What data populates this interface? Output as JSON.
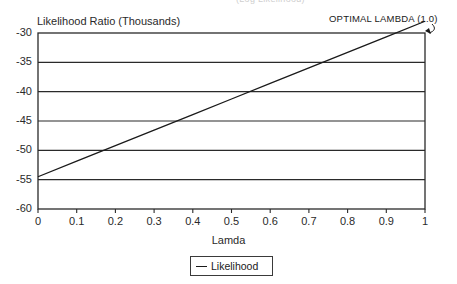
{
  "clipped_top_text": "(Log Likelihood)",
  "annotation": {
    "text": "OPTIMAL LAMBDA (1.0)",
    "arrow_icon": "curved-arrow-icon"
  },
  "legend": {
    "position": "bottom-center",
    "entries": [
      {
        "label": "Likelihood",
        "color": "#1a1a1a",
        "marker": "line-swatch-icon"
      }
    ]
  },
  "chart_data": {
    "type": "line",
    "title": "",
    "xlabel": "Lamda",
    "ylabel": "Likelihood Ratio (Thousands)",
    "xlim": [
      0,
      1
    ],
    "ylim": [
      -60,
      -30
    ],
    "grid": true,
    "xticks": [
      "0",
      "0.1",
      "0.2",
      "0.3",
      "0.4",
      "0.5",
      "0.6",
      "0.7",
      "0.8",
      "0.9",
      "1"
    ],
    "xtick_values": [
      0,
      0.1,
      0.2,
      0.3,
      0.4,
      0.5,
      0.6,
      0.7,
      0.8,
      0.9,
      1
    ],
    "yticks": [
      "-30",
      "-35",
      "-40",
      "-45",
      "-50",
      "-55",
      "-60"
    ],
    "ytick_values": [
      -30,
      -35,
      -40,
      -45,
      -50,
      -55,
      -60
    ],
    "series": [
      {
        "name": "Likelihood",
        "color": "#1a1a1a",
        "x": [
          0,
          0.1,
          0.2,
          0.3,
          0.4,
          0.5,
          0.6,
          0.7,
          0.8,
          0.9,
          1
        ],
        "values": [
          -54.5,
          -51.85,
          -49.2,
          -46.55,
          -43.9,
          -41.25,
          -38.6,
          -35.95,
          -33.3,
          -30.65,
          -28
        ]
      }
    ]
  }
}
